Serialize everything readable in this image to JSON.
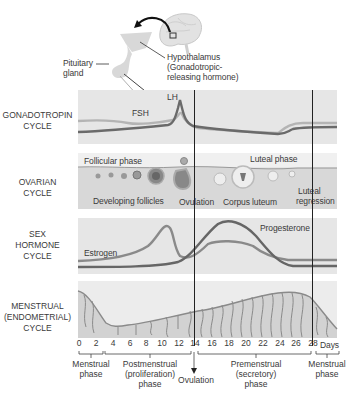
{
  "header": {
    "pituitary_label": [
      "Pituitary",
      "gland"
    ],
    "hypothalamus_label": [
      "Hypothalamus",
      "(Gonadotropic-",
      "releasing hormone)"
    ]
  },
  "rows": [
    {
      "id": "gonadotropin",
      "label": [
        "GONADOTROPIN",
        "CYCLE"
      ]
    },
    {
      "id": "ovarian",
      "label": [
        "OVARIAN",
        "CYCLE"
      ]
    },
    {
      "id": "sex_hormone",
      "label": [
        "SEX",
        "HORMONE",
        "CYCLE"
      ]
    },
    {
      "id": "menstrual",
      "label": [
        "MENSTRUAL",
        "(ENDOMETRIAL)",
        "CYCLE"
      ]
    }
  ],
  "gonadotropin": {
    "lh_label": "LH",
    "fsh_label": "FSH"
  },
  "ovarian": {
    "follicular_phase": "Follicular phase",
    "luteal_phase": "Luteal phase",
    "developing_follicles": "Developing follicles",
    "ovulation": "Ovulation",
    "corpus_luteum": "Corpus luteum",
    "luteal_regression": [
      "Luteal",
      "regression"
    ]
  },
  "sex_hormone": {
    "estrogen_label": "Estrogen",
    "progesterone_label": "Progesterone"
  },
  "axis": {
    "ticks": [
      "0",
      "2",
      "4",
      "6",
      "8",
      "10",
      "12",
      "14",
      "16",
      "18",
      "20",
      "22",
      "24",
      "26",
      "28"
    ],
    "unit": "Days"
  },
  "phases": {
    "menstrual_start": [
      "Menstrual",
      "phase"
    ],
    "postmenstrual": [
      "Postmenstrual",
      "(proliferation)",
      "phase"
    ],
    "ovulation": "Ovulation",
    "premenstrual": [
      "Premenstrual",
      "(secretory)",
      "phase"
    ],
    "menstrual_end": [
      "Menstrual",
      "phase"
    ]
  },
  "colors": {
    "panel_bg": "#e6e6e6",
    "line_dark": "#6a6a6a",
    "line_light": "#a8a8a8",
    "divider": "#222222",
    "text": "#3a3a3a"
  }
}
